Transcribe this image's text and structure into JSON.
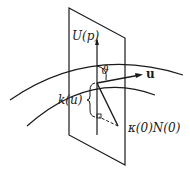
{
  "figure": {
    "labels": {
      "plane": "U(p)",
      "direction": "u",
      "angle": "ϑ",
      "normal_curvature": "k(u)",
      "curvature_vector": "κ(0)N(0)"
    },
    "colors": {
      "stroke": "#1a1a1a",
      "background": "#ffffff"
    }
  }
}
